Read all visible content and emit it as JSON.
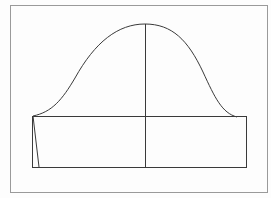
{
  "diagram": {
    "type": "sleeve-pattern",
    "frame": {
      "x": 10,
      "y": 5,
      "width": 258,
      "height": 188,
      "stroke": "#9a9a9a"
    },
    "line_color": "#3a3a3a",
    "sleeve_cap": {
      "start": [
        33,
        116
      ],
      "peak": [
        145,
        24
      ],
      "end": [
        237,
        117
      ]
    },
    "rectangle": {
      "x": 32,
      "y": 116,
      "width": 214,
      "height": 51
    },
    "center_line": {
      "x": 145,
      "y1": 24,
      "y2": 167
    },
    "slant_line": {
      "x1": 33,
      "y1": 116,
      "x2": 39,
      "y2": 167
    }
  }
}
